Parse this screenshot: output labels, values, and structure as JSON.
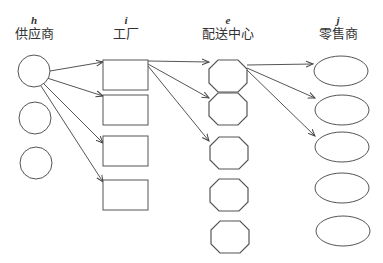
{
  "diagram": {
    "type": "supply-chain-network",
    "stroke_color": "#555555",
    "columns": [
      {
        "id": "h",
        "key": "h",
        "label": "供应商",
        "shape": "circle",
        "center_x": 34,
        "nodes": 3
      },
      {
        "id": "i",
        "key": "i",
        "label": "工厂",
        "shape": "rectangle",
        "center_x": 126,
        "nodes": 4
      },
      {
        "id": "e",
        "key": "e",
        "label": "配送中心",
        "shape": "octagon",
        "center_x": 228,
        "nodes": 5
      },
      {
        "id": "j",
        "key": "j",
        "label": "零售商",
        "shape": "ellipse",
        "center_x": 342,
        "nodes": 5
      }
    ],
    "nodes": {
      "h": [
        {
          "cx": 34,
          "cy": 71,
          "r": 16
        },
        {
          "cx": 35,
          "cy": 118,
          "r": 16
        },
        {
          "cx": 36,
          "cy": 163,
          "r": 16
        }
      ],
      "i": [
        {
          "x": 103,
          "y": 60,
          "w": 45,
          "h": 30
        },
        {
          "x": 103,
          "y": 95,
          "w": 45,
          "h": 30
        },
        {
          "x": 103,
          "y": 136,
          "w": 45,
          "h": 30
        },
        {
          "x": 103,
          "y": 180,
          "w": 45,
          "h": 30
        }
      ],
      "e": [
        {
          "cx": 228,
          "cy": 76,
          "w": 38,
          "h": 32
        },
        {
          "cx": 228,
          "cy": 109,
          "w": 38,
          "h": 32
        },
        {
          "cx": 229,
          "cy": 153,
          "w": 38,
          "h": 32
        },
        {
          "cx": 229,
          "cy": 195,
          "w": 38,
          "h": 32
        },
        {
          "cx": 230,
          "cy": 237,
          "w": 38,
          "h": 32
        }
      ],
      "j": [
        {
          "cx": 341,
          "cy": 71,
          "rx": 27,
          "ry": 15
        },
        {
          "cx": 342,
          "cy": 110,
          "rx": 27,
          "ry": 15
        },
        {
          "cx": 342,
          "cy": 147,
          "rx": 27,
          "ry": 15
        },
        {
          "cx": 342,
          "cy": 188,
          "rx": 27,
          "ry": 15
        },
        {
          "cx": 343,
          "cy": 231,
          "rx": 27,
          "ry": 15
        }
      ]
    },
    "edges": [
      {
        "from": "h0",
        "to": "i0",
        "x1": 50,
        "y1": 71,
        "x2": 103,
        "y2": 62
      },
      {
        "from": "h0",
        "to": "i1",
        "x1": 47,
        "y1": 78,
        "x2": 103,
        "y2": 96
      },
      {
        "from": "h0",
        "to": "i2",
        "x1": 44,
        "y1": 84,
        "x2": 103,
        "y2": 143
      },
      {
        "from": "h0",
        "to": "i3",
        "x1": 41,
        "y1": 86,
        "x2": 103,
        "y2": 182
      },
      {
        "from": "i0",
        "to": "e0",
        "x1": 148,
        "y1": 61,
        "x2": 209,
        "y2": 62
      },
      {
        "from": "i0",
        "to": "e1",
        "x1": 148,
        "y1": 64,
        "x2": 209,
        "y2": 98
      },
      {
        "from": "i0",
        "to": "e2",
        "x1": 148,
        "y1": 66,
        "x2": 209,
        "y2": 141
      },
      {
        "from": "e0",
        "to": "j0",
        "x1": 247,
        "y1": 65,
        "x2": 313,
        "y2": 64
      },
      {
        "from": "e0",
        "to": "j1",
        "x1": 247,
        "y1": 68,
        "x2": 315,
        "y2": 98
      },
      {
        "from": "e0",
        "to": "j2",
        "x1": 247,
        "y1": 70,
        "x2": 315,
        "y2": 136
      }
    ]
  }
}
